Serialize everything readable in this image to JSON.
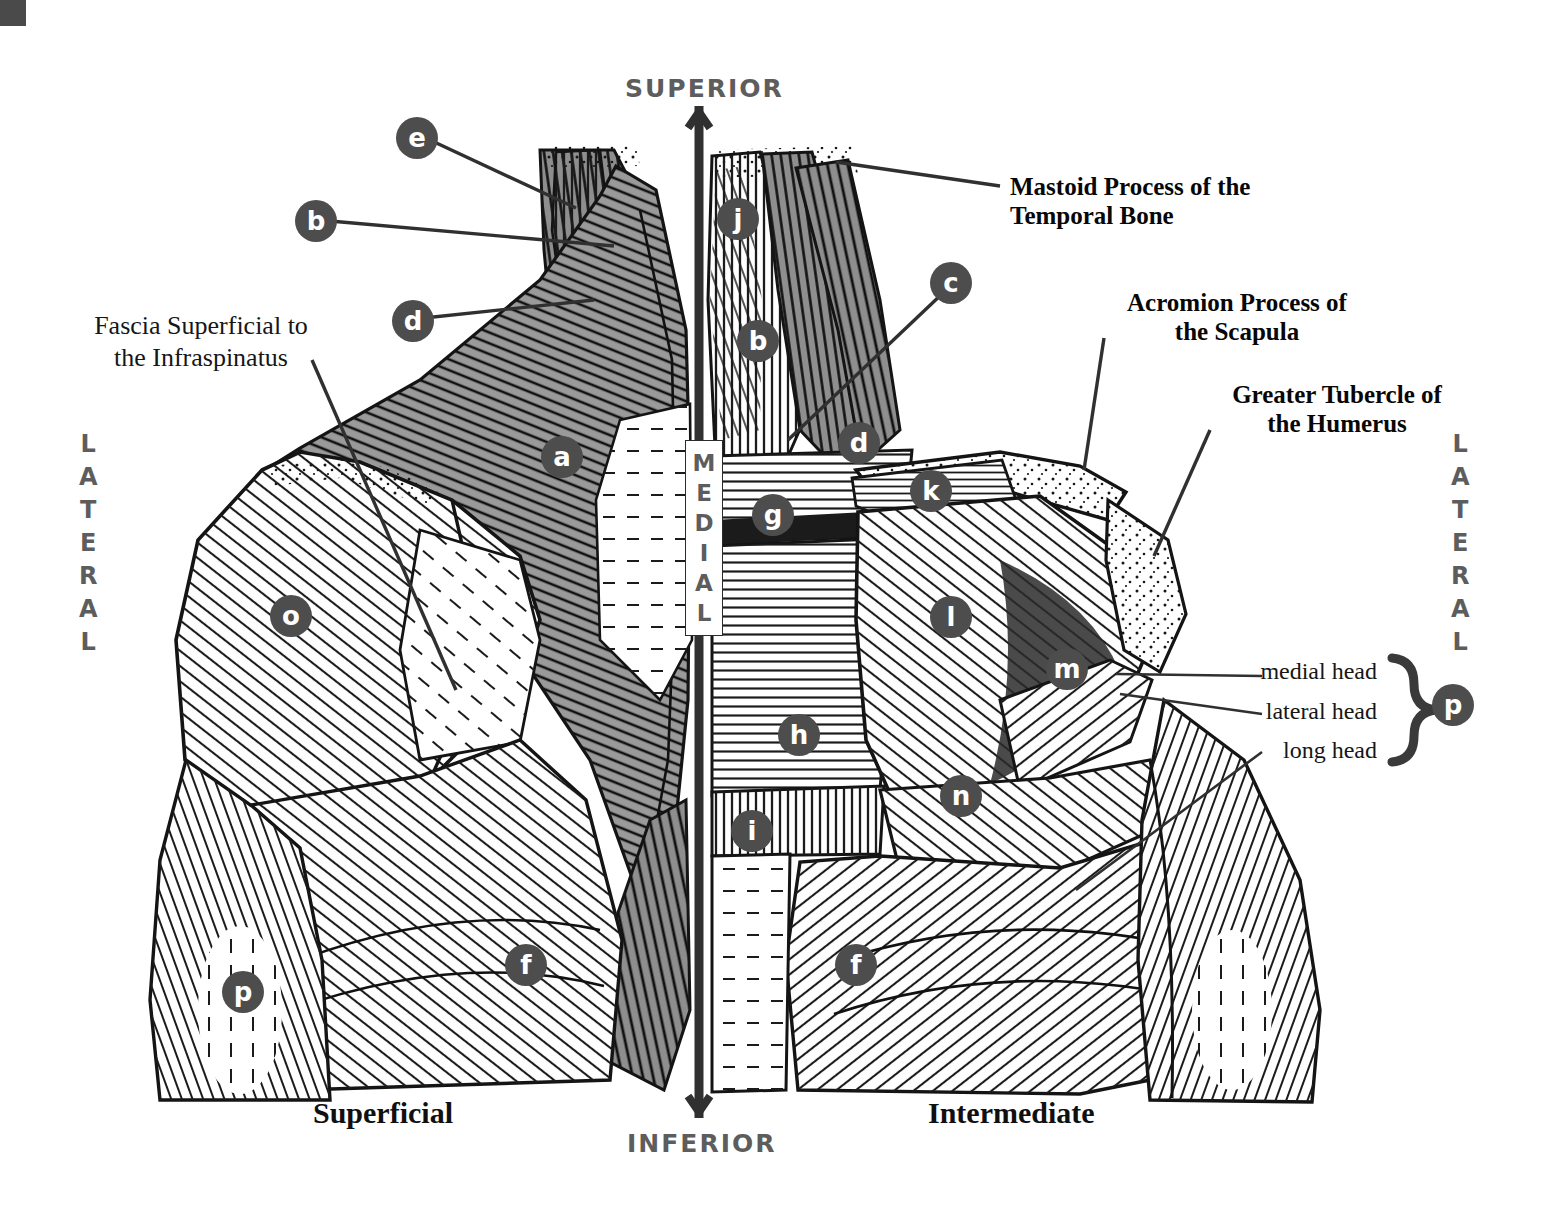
{
  "figure": {
    "title_absent": true,
    "orientation": {
      "superior": "SUPERIOR",
      "inferior": "INFERIOR",
      "medial": "MEDIAL",
      "medial_letters": [
        "M",
        "E",
        "D",
        "I",
        "A",
        "L"
      ],
      "lateral_left": [
        "L",
        "A",
        "T",
        "E",
        "R",
        "A",
        "L"
      ],
      "lateral_right": [
        "L",
        "A",
        "T",
        "E",
        "R",
        "A",
        "L"
      ],
      "lateral_label": "LATERAL"
    },
    "views": {
      "left_caption": "Superficial",
      "right_caption": "Intermediate"
    },
    "callouts": [
      {
        "id": "mastoid",
        "line1": "Mastoid Process of the",
        "line2": "Temporal Bone"
      },
      {
        "id": "acromion",
        "line1": "Acromion Process of",
        "line2": "the Scapula"
      },
      {
        "id": "tubercle",
        "line1": "Greater Tubercle of",
        "line2": "the Humerus"
      }
    ],
    "soft_labels": [
      {
        "id": "fascia",
        "line1": "Fascia Superficial to",
        "line2": "the Infraspinatus"
      }
    ],
    "triceps_heads": {
      "medial": "medial head",
      "lateral": "lateral head",
      "long": "long head",
      "brace_marker": "p"
    },
    "markers": [
      {
        "letter": "e",
        "x": 396,
        "y": 117,
        "size": "big"
      },
      {
        "letter": "b",
        "x": 295,
        "y": 200,
        "size": "big"
      },
      {
        "letter": "d",
        "x": 392,
        "y": 300,
        "size": "big"
      },
      {
        "letter": "a",
        "x": 541,
        "y": 436,
        "size": "big"
      },
      {
        "letter": "o",
        "x": 270,
        "y": 595,
        "size": "big"
      },
      {
        "letter": "p",
        "x": 222,
        "y": 971,
        "size": "big"
      },
      {
        "letter": "f",
        "x": 505,
        "y": 944,
        "size": "big"
      },
      {
        "letter": "j",
        "x": 717,
        "y": 198,
        "size": "big"
      },
      {
        "letter": "b",
        "x": 737,
        "y": 320,
        "size": "big"
      },
      {
        "letter": "c",
        "x": 930,
        "y": 262,
        "size": "big"
      },
      {
        "letter": "d",
        "x": 838,
        "y": 422,
        "size": "big"
      },
      {
        "letter": "g",
        "x": 752,
        "y": 494,
        "size": "big"
      },
      {
        "letter": "k",
        "x": 910,
        "y": 470,
        "size": "big"
      },
      {
        "letter": "l",
        "x": 930,
        "y": 596,
        "size": "big"
      },
      {
        "letter": "m",
        "x": 1046,
        "y": 648,
        "size": "big"
      },
      {
        "letter": "h",
        "x": 778,
        "y": 714,
        "size": "big"
      },
      {
        "letter": "n",
        "x": 940,
        "y": 775,
        "size": "big"
      },
      {
        "letter": "i",
        "x": 731,
        "y": 810,
        "size": "big"
      },
      {
        "letter": "f",
        "x": 835,
        "y": 944,
        "size": "big"
      },
      {
        "letter": "p",
        "x": 1432,
        "y": 684,
        "size": "big"
      }
    ],
    "colors": {
      "marker_fill": "#4d4d4d",
      "marker_text": "#ffffff",
      "orientation_text": "#5d5d5d",
      "callout_text": "#070707",
      "line": "#303030",
      "trapezius_shade": "#8d8d8d",
      "background": "#ffffff"
    }
  }
}
